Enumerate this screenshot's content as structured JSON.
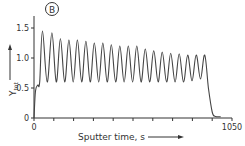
{
  "panel_label": "B",
  "chart_data": {
    "type": "line",
    "title": "",
    "panel": "B",
    "xlabel": "Sputter time, s",
    "ylabel": "Y_tot",
    "xlim": [
      0,
      1050
    ],
    "ylim": [
      0,
      1.5
    ],
    "x_ticks": [
      0,
      1050
    ],
    "x_tick_labels": [
      "0",
      "1050"
    ],
    "x_minor_ticks": [
      0,
      105,
      210,
      315,
      420,
      525,
      630,
      735,
      840,
      945,
      1050
    ],
    "y_ticks": [
      0,
      0.5,
      1.0,
      1.5
    ],
    "y_tick_labels": [
      "0",
      "0.5",
      "1.0",
      "1.5"
    ],
    "grid": false,
    "legend": null,
    "series": [
      {
        "name": "Y_tot",
        "description": "Oscillating total yield: ~21 periods, peaks decaying from ~1.45 to ~1.05, troughs ~0.6, dropping to ~0 at ~950 s",
        "peaks_x": [
          45,
          95,
          140,
          185,
          230,
          275,
          320,
          365,
          410,
          455,
          500,
          545,
          590,
          635,
          680,
          725,
          770,
          815,
          860,
          905
        ],
        "peaks_y": [
          1.45,
          1.42,
          1.32,
          1.3,
          1.3,
          1.28,
          1.25,
          1.25,
          1.22,
          1.2,
          1.2,
          1.2,
          1.15,
          1.12,
          1.1,
          1.08,
          1.07,
          1.05,
          1.05,
          1.05
        ],
        "trough_y": 0.6,
        "points": [
          [
            0,
            0
          ],
          [
            8,
            0.45
          ],
          [
            20,
            0.55
          ],
          [
            30,
            0.6
          ],
          [
            45,
            1.45
          ],
          [
            70,
            0.6
          ],
          [
            95,
            1.42
          ],
          [
            118,
            0.6
          ],
          [
            140,
            1.32
          ],
          [
            163,
            0.6
          ],
          [
            185,
            1.3
          ],
          [
            208,
            0.6
          ],
          [
            230,
            1.3
          ],
          [
            253,
            0.6
          ],
          [
            275,
            1.28
          ],
          [
            298,
            0.6
          ],
          [
            320,
            1.25
          ],
          [
            343,
            0.6
          ],
          [
            365,
            1.25
          ],
          [
            388,
            0.6
          ],
          [
            410,
            1.22
          ],
          [
            433,
            0.6
          ],
          [
            455,
            1.2
          ],
          [
            478,
            0.6
          ],
          [
            500,
            1.2
          ],
          [
            523,
            0.6
          ],
          [
            545,
            1.2
          ],
          [
            568,
            0.6
          ],
          [
            590,
            1.15
          ],
          [
            613,
            0.6
          ],
          [
            635,
            1.12
          ],
          [
            658,
            0.6
          ],
          [
            680,
            1.1
          ],
          [
            703,
            0.6
          ],
          [
            725,
            1.08
          ],
          [
            748,
            0.6
          ],
          [
            770,
            1.07
          ],
          [
            793,
            0.6
          ],
          [
            815,
            1.05
          ],
          [
            838,
            0.62
          ],
          [
            860,
            1.05
          ],
          [
            883,
            0.65
          ],
          [
            905,
            1.05
          ],
          [
            925,
            0.5
          ],
          [
            945,
            0.1
          ],
          [
            960,
            0.03
          ],
          [
            990,
            0.02
          ]
        ]
      }
    ],
    "annotations": [
      "B (circled panel label)",
      "arrow along x-axis label",
      "arrow along y-axis label"
    ]
  }
}
